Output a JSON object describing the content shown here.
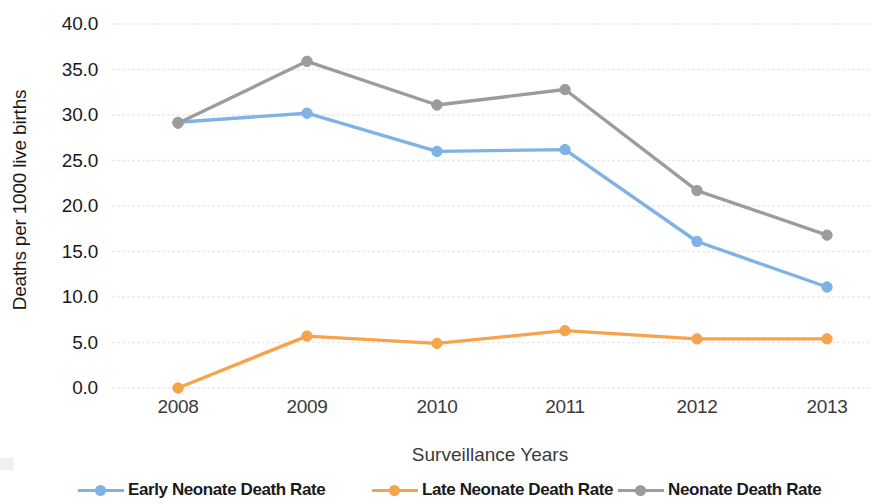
{
  "chart_data": {
    "type": "line",
    "title": "",
    "xlabel": "Surveillance Years",
    "ylabel": "Deaths per 1000 live births",
    "categories": [
      "2008",
      "2009",
      "2010",
      "2011",
      "2012",
      "2013"
    ],
    "ylim": [
      0,
      40
    ],
    "ytick_labels": [
      "0.0",
      "5.0",
      "10.0",
      "15.0",
      "20.0",
      "25.0",
      "30.0",
      "35.0",
      "40.0"
    ],
    "ytick_values": [
      0,
      5,
      10,
      15,
      20,
      25,
      30,
      35,
      40
    ],
    "grid": true,
    "grid_axis": "y",
    "legend_position": "bottom",
    "series": [
      {
        "name": "Early Neonate Death Rate",
        "color": "#7FB2E5",
        "marker": "circle",
        "values": [
          29.2,
          30.2,
          26.0,
          26.2,
          16.1,
          11.1
        ]
      },
      {
        "name": "Late Neonate Death Rate",
        "color": "#F5A košt",
        "values": [
          0.0,
          5.7,
          4.9,
          6.3,
          5.4,
          5.4
        ]
      },
      {
        "name": "Neonate Death Rate",
        "color": "#999999",
        "marker": "circle",
        "values": [
          29.1,
          35.9,
          31.1,
          32.8,
          21.7,
          16.8
        ]
      }
    ]
  },
  "legend": {
    "items": [
      {
        "label": "Early Neonate Death Rate",
        "color": "#7FB2E5"
      },
      {
        "label": "Late Neonate Death Rate",
        "color": "#F5A44B"
      },
      {
        "label": "Neonate Death Rate",
        "color": "#9C9C9C"
      }
    ]
  },
  "colors": {
    "early_neonate": "#7FB2E5",
    "late_neonate": "#F5A44B",
    "neonate": "#9C9C9C",
    "gridline": "#EAEAEA",
    "text": "#1a1a1a"
  }
}
